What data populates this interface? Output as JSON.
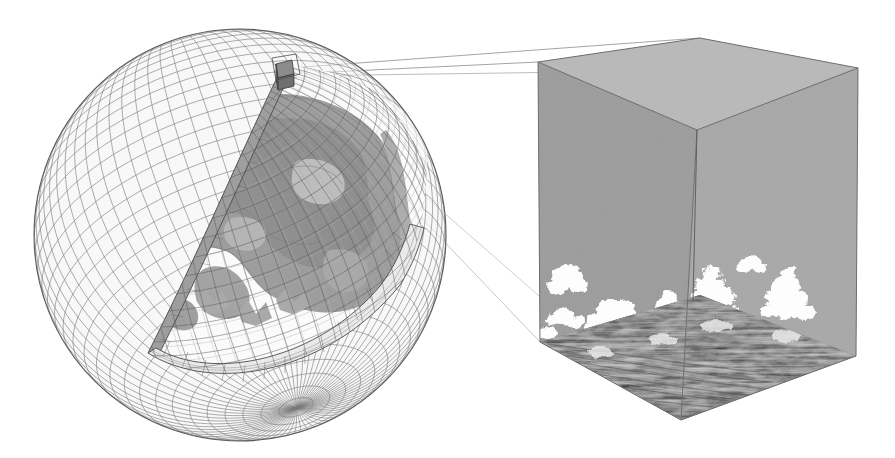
{
  "figure": {
    "title": "Multiscale climate model schematic: global model grid with embedded cloud-resolving domain",
    "background_color": "#ffffff",
    "width": 895,
    "height": 458,
    "caption": ""
  },
  "globe": {
    "name": "global-model-sphere",
    "description": "Wireframe latitude-longitude mesh sphere with a wedge cut away revealing the interior field",
    "center": {
      "x": 240,
      "y": 235
    },
    "radius": 206,
    "mesh": {
      "latitude_spacing_deg": 5,
      "longitude_spacing_deg": 5,
      "line_color": "#6b6b6b",
      "fill_color": "#f2f2f2",
      "fill_opacity": 0.55
    },
    "cut_wedge": {
      "label": "cut-away wedge",
      "shell_face_color": "#9a9a9a",
      "shell_edge_color": "#4a4a4a",
      "pole_convergence": {
        "x": 148,
        "y": 353
      },
      "top_corner": {
        "x": 283,
        "y": 66
      }
    },
    "interior_field": {
      "label": "interior scalar field / continents",
      "background_color": "#fbfbfb",
      "patch_color_dark": "#9d9d9d",
      "patch_color_mid": "#bdbdbd",
      "patch_color_light": "#e8e8e8",
      "contour_color": "#777777"
    },
    "embedded_cell": {
      "label": "embedded grid cell (magnified at right)",
      "face_color": "#707070",
      "edge_color": "#3a3a3a",
      "position": {
        "x": 284,
        "y": 72
      },
      "size": 17
    }
  },
  "projection": {
    "name": "magnification-frustum",
    "description": "Four thin lines projecting from the embedded grid cell to the corners of the magnified cube",
    "line_color": "#9a9a9a",
    "line_width": 0.9,
    "source": {
      "x": 284,
      "y": 72
    },
    "targets": [
      {
        "x": 538,
        "y": 62
      },
      {
        "x": 858,
        "y": 68
      },
      {
        "x": 540,
        "y": 342
      },
      {
        "x": 856,
        "y": 356
      }
    ]
  },
  "cube": {
    "name": "cloud-resolving-domain-cube",
    "description": "Magnified large-eddy-simulation domain rendered as a cube with cloud field and turbulent surface",
    "faces": {
      "top": {
        "label": "domain top",
        "color": "#b9b9b9"
      },
      "left": {
        "label": "left lateral boundary",
        "color": "#9b9b9b"
      },
      "right": {
        "label": "right lateral boundary",
        "color": "#a6a6a6"
      },
      "bottom": {
        "label": "surface layer / turbulent flux field",
        "color": "#8a8a8a"
      }
    },
    "edge_color": "#6f6f6f",
    "vertices": {
      "top_back": {
        "x": 700,
        "y": 38
      },
      "top_left": {
        "x": 538,
        "y": 62
      },
      "top_front": {
        "x": 697,
        "y": 130
      },
      "top_right": {
        "x": 858,
        "y": 68
      },
      "bot_left": {
        "x": 540,
        "y": 342
      },
      "bot_front": {
        "x": 681,
        "y": 420
      },
      "bot_right": {
        "x": 856,
        "y": 356
      }
    },
    "clouds": {
      "label": "shallow cumulus cloud field",
      "color": "#fdfdfd",
      "count": 11
    },
    "surface": {
      "label": "turbulent surface texture",
      "dark_color": "#5a5a5a",
      "light_color": "#c8c8c8"
    }
  }
}
